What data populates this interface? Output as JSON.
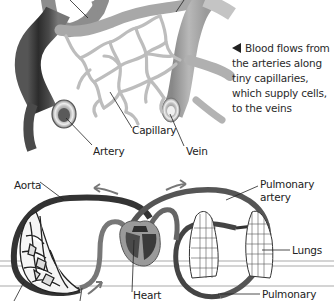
{
  "diagram": {
    "top_panel": {
      "caption": "Blood flows from the arteries along tiny capillaries, which supply cells, to the veins",
      "caption_lines": [
        "Blood flows from",
        "the arteries along",
        "tiny capillaries,",
        "which supply cells,",
        "to the veins"
      ],
      "labels": {
        "capillary": "Capillary",
        "artery": "Artery",
        "vein": "Vein"
      }
    },
    "bottom_panel": {
      "labels": {
        "aorta": "Aorta",
        "pulmonary_artery_line1": "Pulmonary",
        "pulmonary_artery_line2": "artery",
        "lungs": "Lungs",
        "heart": "Heart",
        "pulmonary_vein_line1": "Pulmonary"
      }
    },
    "colors": {
      "artery_dark": "#3a3a3a",
      "vein_light": "#9a9a9a",
      "capillary": "#bdbdbd",
      "background": "#ffffff",
      "text": "#222222"
    }
  }
}
